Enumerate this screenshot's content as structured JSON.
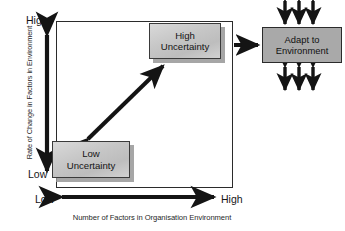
{
  "diagram": {
    "type": "2x2 uncertainty matrix with environment adaptation",
    "y_axis": {
      "title": "Rate of Change in Factors in Environment",
      "high_label": "High",
      "low_label": "Low"
    },
    "x_axis": {
      "title": "Number of Factors in Organisation Environment",
      "low_label": "Low",
      "high_label": "High"
    },
    "nodes": {
      "high_uncertainty": {
        "line1": "High",
        "line2": "Uncertainty",
        "fill": "#c6c6c6"
      },
      "low_uncertainty": {
        "line1": "Low",
        "line2": "Uncertainty",
        "fill": "#c6c6c6"
      },
      "adapt": {
        "line1": "Adapt to",
        "line2": "Environment",
        "fill": "#a9a9a9"
      }
    },
    "connectors": {
      "diagonal": "double-headed-arrow-low-to-high-uncertainty",
      "to_adapt": "right-arrow",
      "adapt_top": "three-double-headed-vertical-arrows",
      "adapt_bottom": "three-double-headed-vertical-arrows"
    },
    "colors": {
      "stroke": "#2b2b2b",
      "box_light": "#c6c6c6",
      "box_dark": "#a9a9a9",
      "shadow": "#969696",
      "background": "#ffffff"
    }
  }
}
